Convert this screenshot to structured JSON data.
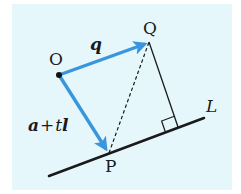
{
  "diagram": {
    "points": {
      "O": {
        "label": "O",
        "x": 59,
        "y": 75
      },
      "Q": {
        "label": "Q",
        "x": 149,
        "y": 42
      },
      "P": {
        "label": "P",
        "x": 109,
        "y": 153
      },
      "F": {
        "x": 178,
        "y": 127
      }
    },
    "line_L": {
      "label": "L",
      "x1": 49,
      "y1": 176,
      "x2": 204,
      "y2": 118
    },
    "vectors": [
      {
        "from": "O",
        "to": "Q",
        "label": "q"
      },
      {
        "from": "O",
        "to": "P",
        "label_parts": [
          "a",
          " + ",
          "t",
          "l"
        ]
      }
    ],
    "colors": {
      "background": "#e6f7fb",
      "vector": "#3a96dc",
      "line": "#1a1a1a"
    }
  },
  "labels": {
    "O": "O",
    "Q": "Q",
    "P": "P",
    "L": "L",
    "q": "q",
    "a": "a",
    "plus": "+",
    "t": "t",
    "l": "l"
  }
}
